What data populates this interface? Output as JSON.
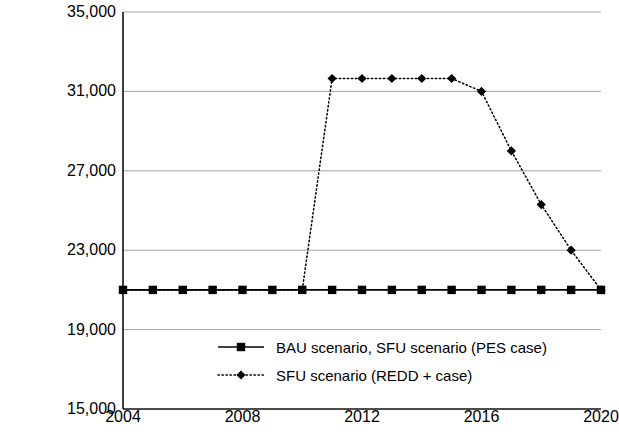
{
  "chart_data": {
    "type": "line",
    "title": "",
    "xlabel": "",
    "ylabel": "Volume (1000m3)",
    "ylabel_main": "Volume (1000m",
    "ylabel_sup": "3",
    "ylabel_close": ")",
    "x": [
      2004,
      2005,
      2006,
      2007,
      2008,
      2009,
      2010,
      2011,
      2012,
      2013,
      2014,
      2015,
      2016,
      2017,
      2018,
      2019,
      2020
    ],
    "xlim": [
      2004,
      2020
    ],
    "ylim": [
      15000,
      35000
    ],
    "yticks": [
      15000,
      19000,
      23000,
      27000,
      31000,
      35000
    ],
    "ytick_labels": [
      "15,000",
      "19,000",
      "23,000",
      "27,000",
      "31,000",
      "35,000"
    ],
    "xticks": [
      2004,
      2008,
      2012,
      2016,
      2020
    ],
    "xtick_labels": [
      "2004",
      "2008",
      "2012",
      "2016",
      "2020"
    ],
    "grid": true,
    "grid_axis": "y",
    "legend_position": "inside-bottom-center",
    "series": [
      {
        "name": "BAU scenario, SFU scenario (PES case)",
        "marker": "square",
        "linestyle": "solid",
        "color": "#000000",
        "values": [
          21000,
          21000,
          21000,
          21000,
          21000,
          21000,
          21000,
          21000,
          21000,
          21000,
          21000,
          21000,
          21000,
          21000,
          21000,
          21000,
          21000
        ]
      },
      {
        "name": "SFU scenario (REDD + case)",
        "marker": "diamond",
        "linestyle": "dotted",
        "color": "#000000",
        "values": [
          21000,
          21000,
          21000,
          21000,
          21000,
          21000,
          21000,
          31650,
          31650,
          31650,
          31650,
          31650,
          31000,
          28000,
          25300,
          23000,
          21000
        ]
      }
    ]
  },
  "legend": {
    "items": [
      {
        "label": "BAU scenario, SFU scenario (PES case)"
      },
      {
        "label": "SFU scenario (REDD + case)"
      }
    ]
  }
}
